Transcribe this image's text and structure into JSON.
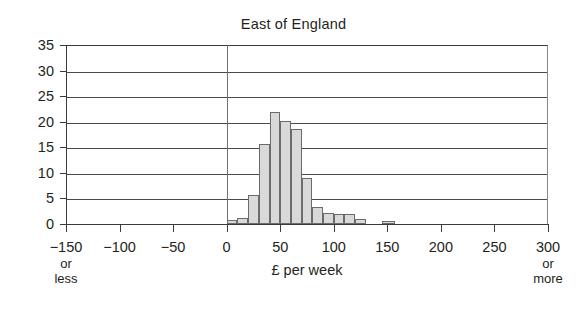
{
  "chart_data": {
    "type": "bar",
    "title": "East of England",
    "xlabel": "£ per week",
    "ylabel": "",
    "xlim": [
      -150,
      300
    ],
    "ylim": [
      0,
      35
    ],
    "grid": true,
    "legend": null,
    "bin_width": 10,
    "x_tick_labels": [
      {
        "value": -150,
        "label": "−150",
        "sub": "or\nless"
      },
      {
        "value": -100,
        "label": "−100",
        "sub": ""
      },
      {
        "value": -50,
        "label": "−50",
        "sub": ""
      },
      {
        "value": 0,
        "label": "0",
        "sub": ""
      },
      {
        "value": 50,
        "label": "50",
        "sub": ""
      },
      {
        "value": 100,
        "label": "100",
        "sub": ""
      },
      {
        "value": 150,
        "label": "150",
        "sub": ""
      },
      {
        "value": 200,
        "label": "200",
        "sub": ""
      },
      {
        "value": 250,
        "label": "250",
        "sub": ""
      },
      {
        "value": 300,
        "label": "300",
        "sub": "or\nmore"
      }
    ],
    "y_tick_labels": [
      "0",
      "5",
      "10",
      "15",
      "20",
      "25",
      "30",
      "35"
    ],
    "y_ticks": [
      0,
      5,
      10,
      15,
      20,
      25,
      30,
      35
    ],
    "x_axis_end_note_left": "or less",
    "x_axis_end_note_right": "or more",
    "bars": [
      {
        "x0": 0,
        "x1": 10,
        "value": 0.8
      },
      {
        "x0": 10,
        "x1": 20,
        "value": 1.2
      },
      {
        "x0": 20,
        "x1": 30,
        "value": 5.6
      },
      {
        "x0": 30,
        "x1": 40,
        "value": 15.6
      },
      {
        "x0": 40,
        "x1": 50,
        "value": 22.0
      },
      {
        "x0": 50,
        "x1": 60,
        "value": 20.2
      },
      {
        "x0": 60,
        "x1": 70,
        "value": 18.5
      },
      {
        "x0": 70,
        "x1": 80,
        "value": 9.0
      },
      {
        "x0": 80,
        "x1": 90,
        "value": 3.4
      },
      {
        "x0": 90,
        "x1": 100,
        "value": 2.2
      },
      {
        "x0": 100,
        "x1": 110,
        "value": 1.9
      },
      {
        "x0": 110,
        "x1": 120,
        "value": 1.9
      },
      {
        "x0": 120,
        "x1": 130,
        "value": 1.0
      },
      {
        "x0": 145,
        "x1": 157,
        "value": 0.5
      }
    ],
    "colors": {
      "bar_fill": "#d9d9d9",
      "bar_edge": "#6b6b6b",
      "grid": "#4a4a4a",
      "axis": "#3a3a3a",
      "text": "#231f20",
      "background": "#ffffff"
    }
  }
}
